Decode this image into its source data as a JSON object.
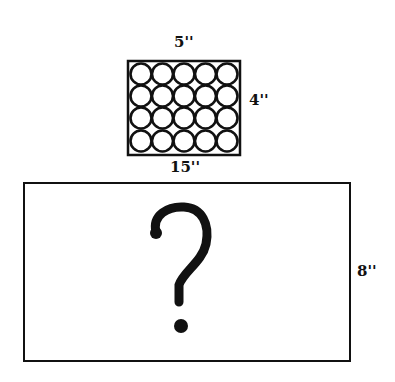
{
  "small_box": {
    "width_label": "5''",
    "height_label": "4''",
    "rows": 4,
    "cols": 5,
    "content": "circles"
  },
  "large_box": {
    "width_label": "15''",
    "height_label": "8''",
    "content_symbol": "?"
  },
  "colors": {
    "stroke": "#111111",
    "background": "#ffffff"
  }
}
